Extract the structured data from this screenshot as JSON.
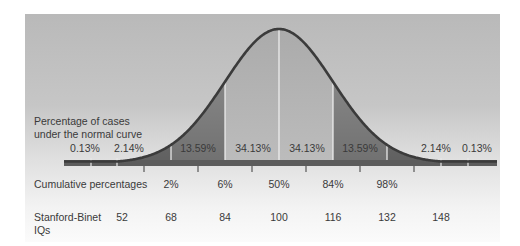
{
  "chart_data": {
    "type": "area",
    "title": "",
    "xlabel": "Stanford-Binet IQs",
    "ylabel": "",
    "mean": 100,
    "sd": 16,
    "region_label_title": "Percentage of cases under the normal curve",
    "regions": [
      {
        "range": "below -3σ",
        "percent": "0.13%",
        "value": 0.13
      },
      {
        "range": "-3σ to -2σ",
        "percent": "2.14%",
        "value": 2.14
      },
      {
        "range": "-2σ to -1σ",
        "percent": "13.59%",
        "value": 13.59
      },
      {
        "range": "-1σ to mean",
        "percent": "34.13%",
        "value": 34.13
      },
      {
        "range": "mean to +1σ",
        "percent": "34.13%",
        "value": 34.13
      },
      {
        "range": "+1σ to +2σ",
        "percent": "13.59%",
        "value": 13.59
      },
      {
        "range": "+2σ to +3σ",
        "percent": "2.14%",
        "value": 2.14
      },
      {
        "range": "above +3σ",
        "percent": "0.13%",
        "value": 0.13
      }
    ],
    "cumulative_label": "Cumulative percentages",
    "cumulative": [
      "2%",
      "6%",
      "50%",
      "84%",
      "98%"
    ],
    "iq_label": "Stanford-Binet IQs",
    "iq_values": [
      "52",
      "68",
      "84",
      "100",
      "116",
      "132",
      "148"
    ]
  },
  "labels": {
    "cases_line1": "Percentage of cases",
    "cases_line2": "under the normal curve",
    "regions": [
      "0.13%",
      "2.14%",
      "13.59%",
      "34.13%",
      "34.13%",
      "13.59%",
      "2.14%",
      "0.13%"
    ],
    "cumulative_title": "Cumulative percentages",
    "cumulative": [
      "2%",
      "6%",
      "50%",
      "84%",
      "98%"
    ],
    "iq_title_line1": "Stanford-Binet",
    "iq_title_line2": "IQs",
    "iq": [
      "52",
      "68",
      "84",
      "100",
      "116",
      "132",
      "148"
    ]
  },
  "colors": {
    "curve": "#3d3d3d",
    "baseline": "#5a5a5a",
    "center_fill": "#a9a9a9",
    "mid_fill": "#8c8c8c",
    "tail_fill": "#6e6e6e",
    "divider": "#f4f4f4",
    "text": "#3a3a3a"
  }
}
